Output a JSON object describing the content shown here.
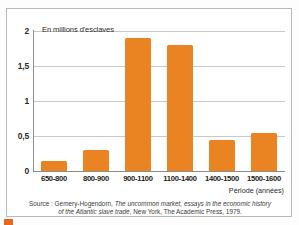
{
  "chart_data": {
    "type": "bar",
    "title": "En millions d'esclaves",
    "xlabel": "Période (années)",
    "ylabel": "",
    "categories": [
      "650-800",
      "800-900",
      "900-1100",
      "1100-1400",
      "1400-1500",
      "1500-1600"
    ],
    "values": [
      0.15,
      0.3,
      1.9,
      1.8,
      0.45,
      0.55
    ],
    "series": [
      {
        "name": "En millions d'esclaves",
        "values": [
          0.15,
          0.3,
          1.9,
          1.8,
          0.45,
          0.55
        ]
      }
    ],
    "ylim": [
      0,
      2
    ],
    "yticks": [
      0,
      0.5,
      1,
      1.5,
      2
    ],
    "ytick_labels": [
      "0",
      "0,5",
      "1",
      "1,5",
      "2"
    ],
    "grid": true,
    "legend": "none",
    "bar_color": "#ea8423"
  },
  "source": {
    "line1_prefix": "Source : Gemery-Hogendorn, ",
    "line1_italic": "The uncommon market, essays in the economic history",
    "line2_italic": "of the Atlantic slave trade",
    "line2_suffix": ", New York, The Academic Press, 1979."
  }
}
